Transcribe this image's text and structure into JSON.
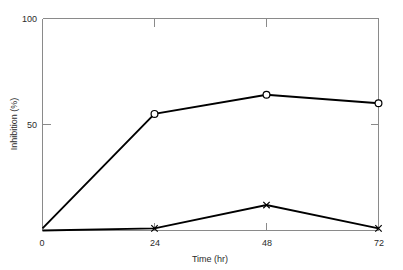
{
  "chart_data": {
    "type": "line",
    "title": "",
    "xlabel": "Time (hr)",
    "ylabel": "Inhibition (%)",
    "x": [
      0,
      24,
      48,
      72
    ],
    "xlim": [
      0,
      72
    ],
    "ylim": [
      0,
      100
    ],
    "xticks": [
      "0",
      "24",
      "48",
      "72"
    ],
    "yticks": [
      "0",
      "50",
      "100"
    ],
    "ytick_values": [
      0,
      50,
      100
    ],
    "ytick_labels_shown": [
      "50",
      "100"
    ],
    "grid": false,
    "legend": "none",
    "series": [
      {
        "name": "series-open-circle",
        "marker": "open-circle",
        "values": [
          1,
          55,
          64,
          60
        ]
      },
      {
        "name": "series-cross",
        "marker": "x-cross",
        "values": [
          0,
          1,
          12,
          1
        ]
      }
    ]
  },
  "axes": {
    "y_label": "Inhibition (%)",
    "y_tick_top": "100",
    "y_tick_mid": "50",
    "x_label": "Time (hr)",
    "x_tick_0": "0",
    "x_tick_1": "24",
    "x_tick_2": "48",
    "x_tick_3": "72"
  },
  "colors": {
    "line": "#000000",
    "frame": "#8a8a8a",
    "text": "#2b2b2b",
    "background": "#ffffff"
  }
}
